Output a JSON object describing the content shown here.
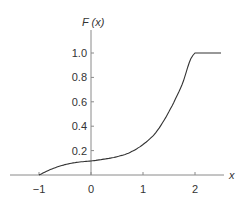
{
  "chart_data": {
    "type": "line",
    "title": "",
    "xlabel": "x",
    "ylabel": "F (x)",
    "xlim": [
      -1.5,
      2.5
    ],
    "ylim": [
      0,
      1.2
    ],
    "grid": false,
    "legend": null,
    "x_ticks": [
      "-1",
      "0",
      "1",
      "2"
    ],
    "y_ticks": [
      "0.2",
      "0.4",
      "0.6",
      "0.8",
      "1.0"
    ],
    "series": [
      {
        "name": "F(x)",
        "x": [
          -1.0,
          -0.75,
          -0.5,
          -0.25,
          0.0,
          0.25,
          0.5,
          0.75,
          1.0,
          1.25,
          1.5,
          1.75,
          2.0,
          2.5
        ],
        "values": [
          0.0,
          0.05,
          0.085,
          0.105,
          0.115,
          0.13,
          0.15,
          0.185,
          0.25,
          0.35,
          0.52,
          0.74,
          1.0,
          1.0
        ]
      }
    ]
  },
  "labels": {
    "y_axis_title": "F (x)",
    "x_axis_title": "x",
    "x_ticks": [
      "−1",
      "0",
      "1",
      "2"
    ],
    "y_ticks": [
      "1.0",
      "0.8",
      "0.6",
      "0.4",
      "0.2"
    ]
  }
}
